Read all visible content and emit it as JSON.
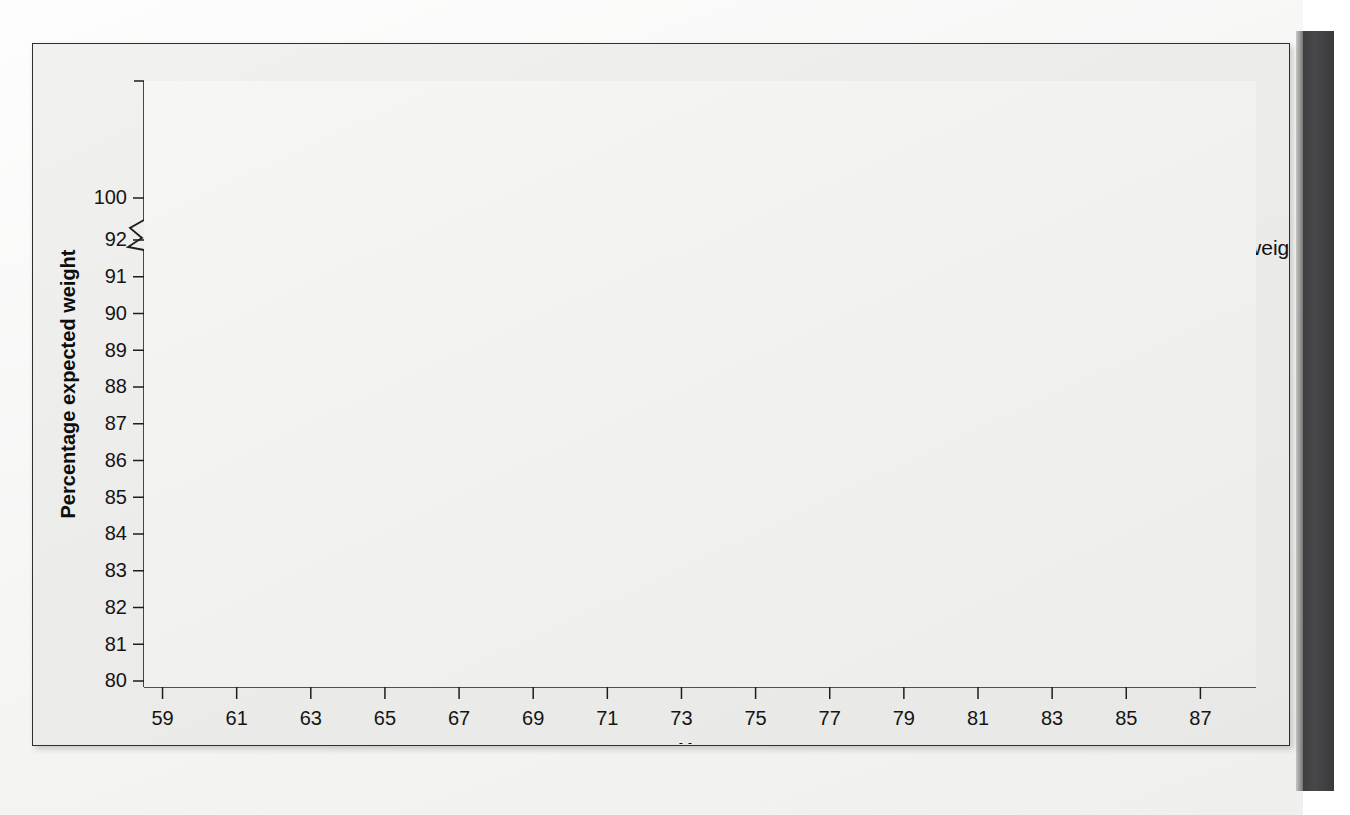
{
  "figure": {
    "background_color": "#eeeeed",
    "frame_color": "#2f2f2f",
    "page_edge_color": "#42424",
    "axis_color": "#1d1d1d",
    "grid_color": "#9a9a9a"
  },
  "chart_data": {
    "type": "line",
    "title": "",
    "xlabel": "Year",
    "ylabel": "Percentage expected weight",
    "xlim": [
      58.5,
      88.5
    ],
    "ylim": [
      80,
      100
    ],
    "grid": true,
    "axis_break": {
      "present": true,
      "between": [
        92,
        100
      ],
      "note": "broken y-axis between 92 and 100"
    },
    "ytick_labels": [
      "80",
      "81",
      "82",
      "83",
      "84",
      "85",
      "86",
      "87",
      "88",
      "89",
      "90",
      "91",
      "92",
      "100"
    ],
    "yticks": [
      80,
      81,
      82,
      83,
      84,
      85,
      86,
      87,
      88,
      89,
      90,
      91,
      92,
      100
    ],
    "xtick_labels": [
      "59",
      "61",
      "63",
      "65",
      "67",
      "69",
      "71",
      "73",
      "75",
      "77",
      "79",
      "81",
      "83",
      "85",
      "87"
    ],
    "xticks": [
      59,
      61,
      63,
      65,
      67,
      69,
      71,
      73,
      75,
      77,
      79,
      81,
      83,
      85,
      87
    ],
    "legend_position": "upper right",
    "series": [
      {
        "name": "Average body weight",
        "color": "#4a4a4a",
        "width": 4.5,
        "italic": false,
        "x": [
          59,
          88
        ],
        "values": [
          100.0,
          104.6
        ]
      },
      {
        "name": "Playboy",
        "color": "#a6a6a6",
        "width": 4.2,
        "italic": true,
        "x": [
          59,
          60,
          61,
          62,
          63,
          64,
          65,
          66,
          67,
          68,
          69,
          70,
          71,
          72,
          73,
          74,
          75,
          76,
          77,
          78
        ],
        "values": [
          91.0,
          88.6,
          90.0,
          89.25,
          90.1,
          90.55,
          87.5,
          88.3,
          87.9,
          85.5,
          89.05,
          88.75,
          88.35,
          86.8,
          86.05,
          88.55,
          85.8,
          86.1,
          88.35,
          82.7
        ]
      },
      {
        "name": "Miss America",
        "color": "#8f8f8f",
        "width": 4.2,
        "italic": false,
        "x": [
          59,
          60,
          61,
          62,
          63,
          64,
          65,
          66,
          67,
          68,
          69,
          70,
          71,
          72,
          73,
          74,
          75,
          76,
          77,
          78,
          79,
          80,
          81,
          82,
          83,
          84,
          85,
          86,
          87,
          88
        ],
        "values": [
          87.15,
          89.0,
          88.6,
          88.0,
          87.25,
          87.35,
          89.15,
          89.25,
          87.8,
          86.1,
          84.8,
          84.05,
          84.2,
          85.4,
          84.1,
          85.6,
          84.2,
          86.1,
          82.1,
          82.75,
          85.05,
          84.6,
          85.55,
          84.3,
          83.9,
          83.75,
          83.7,
          83.55,
          83.8,
          84.1
        ]
      },
      {
        "name": "Miss America lower trace",
        "color": "#a6a6a6",
        "width": 4.2,
        "italic": false,
        "x": [
          79,
          80,
          81,
          82,
          83,
          84,
          85,
          86,
          87,
          88
        ],
        "values": [
          81.5,
          83.7,
          87.0,
          81.0,
          82.4,
          83.1,
          82.85,
          81.6,
          83.3,
          82.1
        ]
      }
    ]
  },
  "legend": {
    "items": [
      {
        "label": "Average body weight",
        "color": "#4a4a4a",
        "italic": false
      },
      {
        "label": "Playboy",
        "color": "#a6a6a6",
        "italic": true
      },
      {
        "label": "Miss America",
        "color": "#8f8f8f",
        "italic": false
      }
    ]
  },
  "axes": {
    "x_title": "Year",
    "y_title": "Percentage expected weight"
  }
}
